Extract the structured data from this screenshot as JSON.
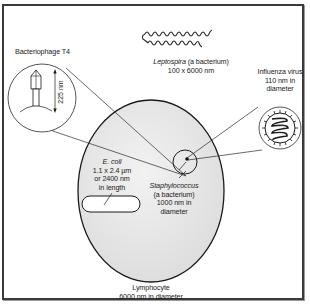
{
  "figure": {
    "type": "size-comparison-diagram",
    "colors": {
      "frame": "#3a3a3a",
      "line": "#1a1a1a",
      "lymphocyte_fill": "#e4e4e4",
      "background": "#ffffff"
    }
  },
  "labels": {
    "bacteriophage": {
      "name": "Bacteriophage T4",
      "size": "225 nm"
    },
    "leptospira": {
      "name_italic": "Leptospira",
      "name_rest": " (a bacterium)",
      "size": "100 x 6000 nm"
    },
    "influenza": {
      "line1": "Influenza virus",
      "line2": "110 nm in",
      "line3": "diameter"
    },
    "ecoli": {
      "name": "E. coli",
      "line2": "1.1 x 2.4 µm",
      "line3": "or 2400 nm",
      "line4": "in length"
    },
    "staphylococcus": {
      "name": "Staphylococcus",
      "line2": "(a bacterium)",
      "line3": "1000 nm in",
      "line4": "diameter"
    },
    "lymphocyte": {
      "line1": "Lymphocyte",
      "line2": "6000 nm in diameter"
    }
  }
}
